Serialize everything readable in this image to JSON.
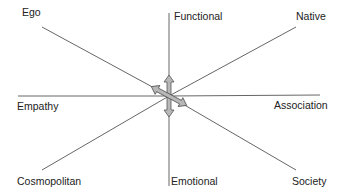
{
  "diagram": {
    "center": {
      "x": 169,
      "y": 96
    },
    "line_color": "#555555",
    "arrow_fill": "#b8b8b8",
    "arrow_stroke": "#555555",
    "axes": [
      {
        "name": "ego-native",
        "from_label": "Ego",
        "to_label": "Native"
      },
      {
        "name": "empathy-association",
        "from_label": "Empathy",
        "to_label": "Association"
      },
      {
        "name": "cosmopolitan-society",
        "from_label": "Cosmopolitan",
        "to_label": "Society"
      },
      {
        "name": "functional-emotional",
        "from_label": "Functional",
        "to_label": "Emotional"
      }
    ],
    "labels": {
      "ego": "Ego",
      "functional": "Functional",
      "native": "Native",
      "empathy": "Empathy",
      "association": "Association",
      "cosmopolitan": "Cosmopolitan",
      "emotional": "Emotional",
      "society": "Society"
    }
  }
}
